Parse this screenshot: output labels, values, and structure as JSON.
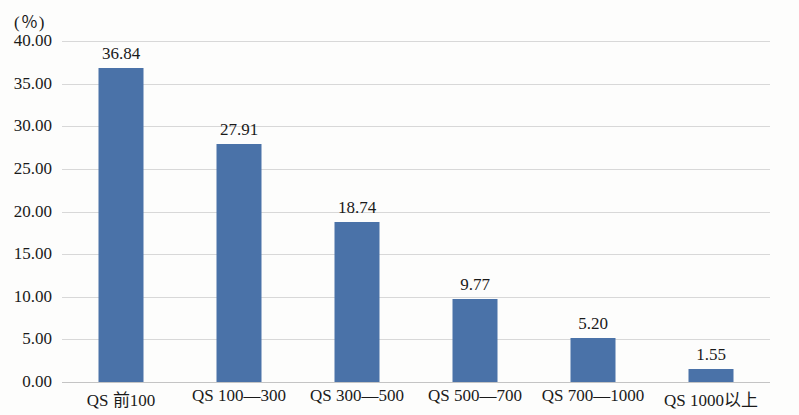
{
  "chart_data": {
    "type": "bar",
    "title": "",
    "xlabel": "",
    "ylabel": "(％)",
    "categories": [
      "QS 前100",
      "QS 100—300",
      "QS 300—500",
      "QS 500—700",
      "QS 700—1000",
      "QS 1000以上"
    ],
    "values": [
      36.84,
      27.91,
      18.74,
      9.77,
      5.2,
      1.55
    ],
    "value_labels": [
      "36.84",
      "27.91",
      "18.74",
      "9.77",
      "5.20",
      "1.55"
    ],
    "ylim": [
      0,
      40
    ],
    "ytick_labels": [
      "40.00",
      "35.00",
      "30.00",
      "25.00",
      "20.00",
      "15.00",
      "10.00",
      "5.00",
      "0.00"
    ],
    "ytick_values": [
      40,
      35,
      30,
      25,
      20,
      15,
      10,
      5,
      0
    ],
    "grid": true,
    "legend": "none",
    "bar_color": "#4a72a8",
    "grid_color": "#d8d8d8"
  }
}
